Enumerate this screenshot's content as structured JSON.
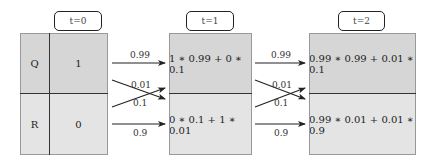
{
  "time_labels": [
    "t=0",
    "t=1",
    "t=2"
  ],
  "states": [
    "Q",
    "R"
  ],
  "t0": {
    "Q": "1",
    "R": "0"
  },
  "t1": {
    "Q": "1 ∗ 0.99 + 0 ∗ 0.1",
    "R": "0 ∗ 0.1 + 1 ∗ 0.01"
  },
  "t2": {
    "Q": "0.99 ∗ 0.99 + 0.01 ∗ 0.1",
    "R": "0.99 ∗ 0.01 + 0.01 ∗ 0.9"
  },
  "transitions": {
    "QQ": "0.99",
    "QR": "0.01",
    "RQ": "0.1",
    "RR": "0.9"
  }
}
